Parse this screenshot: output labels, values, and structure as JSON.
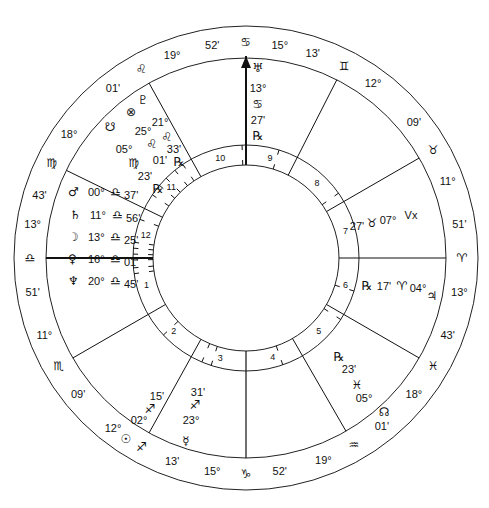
{
  "chart_title": "Natal chart wheel",
  "geometry": {
    "center": [
      246,
      258
    ],
    "outer_radius": 232,
    "zodiac_inner_radius": 200,
    "house_ring_outer_radius": 113,
    "house_ring_inner_radius": 93
  },
  "cusps": [
    {
      "house": 1,
      "angle": 180,
      "label": "ASC",
      "deg": "13°",
      "sign": "♎",
      "min": "51'"
    },
    {
      "house": 2,
      "angle": 210,
      "deg": "11°",
      "sign": "♏",
      "min": "09'"
    },
    {
      "house": 3,
      "angle": 241,
      "deg": "12°",
      "sign": "♐",
      "min": "13'"
    },
    {
      "house": 4,
      "angle": 270,
      "label": "IC",
      "deg": "15°",
      "sign": "♑",
      "min": "52'"
    },
    {
      "house": 5,
      "angle": 300,
      "deg": "19°",
      "sign": "♒",
      "min": "01'"
    },
    {
      "house": 6,
      "angle": 330,
      "deg": "18°",
      "sign": "♓",
      "min": "43'"
    },
    {
      "house": 7,
      "angle": 0,
      "label": "DSC",
      "deg": "13°",
      "sign": "♈",
      "min": "51'"
    },
    {
      "house": 8,
      "angle": 30,
      "deg": "11°",
      "sign": "♉",
      "min": "09'"
    },
    {
      "house": 9,
      "angle": 63,
      "deg": "12°",
      "sign": "♊",
      "min": "13'"
    },
    {
      "house": 10,
      "angle": 90,
      "label": "MC",
      "deg": "15°",
      "sign": "♋",
      "min": "52'"
    },
    {
      "house": 11,
      "angle": 119,
      "deg": "19°",
      "sign": "♌",
      "min": "01'"
    },
    {
      "house": 12,
      "angle": 154,
      "deg": "18°",
      "sign": "♍",
      "min": "43'"
    }
  ],
  "house_numbers": [
    "1",
    "2",
    "3",
    "4",
    "5",
    "6",
    "7",
    "8",
    "9",
    "10",
    "11",
    "12"
  ],
  "planets": [
    {
      "name": "Mars",
      "glyph": "♂",
      "deg": "00°",
      "sign": "♎",
      "min": "37'",
      "retro": false
    },
    {
      "name": "Saturn",
      "glyph": "♄",
      "deg": "11°",
      "sign": "♎",
      "min": "56'",
      "retro": false
    },
    {
      "name": "Moon",
      "glyph": "☽",
      "deg": "13°",
      "sign": "♎",
      "min": "25'",
      "retro": false
    },
    {
      "name": "Venus",
      "glyph": "♀",
      "deg": "16°",
      "sign": "♎",
      "min": "01'",
      "retro": false
    },
    {
      "name": "Neptune",
      "glyph": "♆",
      "deg": "20°",
      "sign": "♎",
      "min": "45'",
      "retro": false
    },
    {
      "name": "Sun",
      "glyph": "☉",
      "deg": "02°",
      "sign": "♐",
      "min": "15'",
      "retro": false
    },
    {
      "name": "Mercury",
      "glyph": "☿",
      "deg": "23°",
      "sign": "♐",
      "min": "31'",
      "retro": false
    },
    {
      "name": "Node",
      "glyph": "☊",
      "deg": "05°",
      "sign": "♓",
      "min": "23'",
      "retro": true
    },
    {
      "name": "Jupiter",
      "glyph": "♃",
      "deg": "04°",
      "sign": "♈",
      "min": "17'",
      "retro": true
    },
    {
      "name": "Vertex",
      "glyph": "Vx",
      "deg": "07°",
      "sign": "♉",
      "min": "27'",
      "retro": false
    },
    {
      "name": "Uranus",
      "glyph": "♅",
      "deg": "13°",
      "sign": "♋",
      "min": "27'",
      "retro": true
    },
    {
      "name": "Pluto",
      "glyph": "♇",
      "deg": "21°",
      "sign": "♌",
      "min": "33'",
      "retro": true
    },
    {
      "name": "Fortune",
      "glyph": "⊗",
      "deg": "25°",
      "sign": "♌",
      "min": "01'",
      "retro": false
    },
    {
      "name": "South Node",
      "glyph": "☋",
      "deg": "05°",
      "sign": "♍",
      "min": "23'",
      "retro": true
    }
  ],
  "labels": {
    "retro": "℞",
    "mc_arrow": "▲"
  }
}
